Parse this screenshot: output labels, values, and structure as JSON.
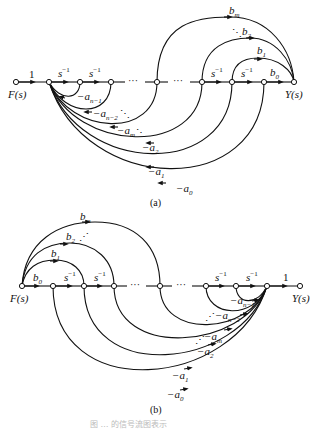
{
  "diagram_a": {
    "caption": "(a)",
    "input_label": "F(s)",
    "output_label": "Y(s)",
    "input_gain": "1",
    "integrator": "s",
    "integrator_exp": "−1",
    "ellipsis": "···",
    "feedforward": [
      {
        "label": "b",
        "sub": "m"
      },
      {
        "label": "b",
        "sub": "2"
      },
      {
        "label": "b",
        "sub": "1"
      },
      {
        "label": "b",
        "sub": "0"
      }
    ],
    "feedback": [
      {
        "label": "−a",
        "sub": "n−1"
      },
      {
        "label": "−a",
        "sub": "n−2"
      },
      {
        "label": "−a",
        "sub": "m"
      },
      {
        "label": "−a",
        "sub": "2"
      },
      {
        "label": "−a",
        "sub": "1"
      },
      {
        "label": "−a",
        "sub": "0"
      }
    ]
  },
  "diagram_b": {
    "caption": "(b)",
    "input_label": "F(s)",
    "output_label": "Y(s)",
    "output_gain": "1",
    "integrator": "s",
    "integrator_exp": "−1",
    "ellipsis": "···",
    "feedforward": [
      {
        "label": "b",
        "sub": "m"
      },
      {
        "label": "b",
        "sub": "2"
      },
      {
        "label": "b",
        "sub": "1"
      },
      {
        "label": "b",
        "sub": "0"
      }
    ],
    "feedback": [
      {
        "label": "−a",
        "sub": "n−1"
      },
      {
        "label": "−a",
        "sub": "n−2"
      },
      {
        "label": "−a",
        "sub": "m"
      },
      {
        "label": "−a",
        "sub": "2"
      },
      {
        "label": "−a",
        "sub": "1"
      },
      {
        "label": "−a",
        "sub": "0"
      }
    ]
  },
  "figure_caption": "图 … 的信号流图表示"
}
